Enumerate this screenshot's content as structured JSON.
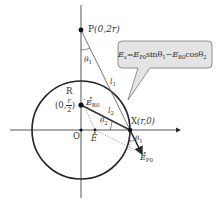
{
  "figure": {
    "points": {
      "P": {
        "name": "P",
        "coords": "(0,2r)"
      },
      "R": {
        "name": "R",
        "coords_prefix": "0,",
        "frac_num": "r",
        "frac_den": "2"
      },
      "O": {
        "name": "O"
      },
      "X": {
        "name": "X",
        "coords": "(r,0)"
      }
    },
    "lengths": {
      "l1": "l",
      "l1_sub": "1",
      "l2": "l",
      "l2_sub": "2"
    },
    "angles": {
      "theta1_top": "θ",
      "theta1_top_sub": "1",
      "theta2": "θ",
      "theta2_sub": "2",
      "theta1_x": "θ",
      "theta1_x_sub": "1"
    },
    "vectors": {
      "E_R0": {
        "symbol": "E",
        "sub": "R0"
      },
      "E": {
        "symbol": "E"
      },
      "E_P0": {
        "symbol": "E",
        "sub": "P0"
      }
    },
    "callout": {
      "lhs": "E",
      "lhs_sub": "x",
      "eq": "=",
      "term1": "E",
      "term1_sub": "P0",
      "term1_fn": "sinθ",
      "term1_fn_sub": "1",
      "minus": "−",
      "term2": "E",
      "term2_sub": "R0",
      "term2_fn": "cosθ",
      "term2_fn_sub": "2"
    },
    "colors": {
      "stroke": "#2a2a2a",
      "thin": "#555555",
      "callout_fill": "#e4e4e4",
      "callout_stroke": "#777777",
      "text": "#333333"
    }
  }
}
